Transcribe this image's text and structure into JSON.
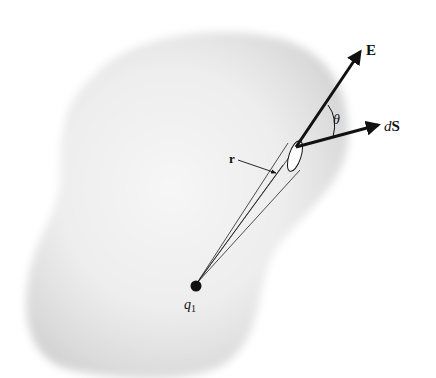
{
  "diagram": {
    "labels": {
      "field_vector": "E",
      "area_vector_prefix": "d",
      "area_vector": "S",
      "angle": "θ",
      "radius": "r",
      "charge_symbol": "q",
      "charge_subscript": "1"
    },
    "colors": {
      "surface_fill_center": "#f4f4f4",
      "surface_fill_edge": "#d6d6d6",
      "ink": "#111111",
      "background": "#ffffff"
    }
  }
}
